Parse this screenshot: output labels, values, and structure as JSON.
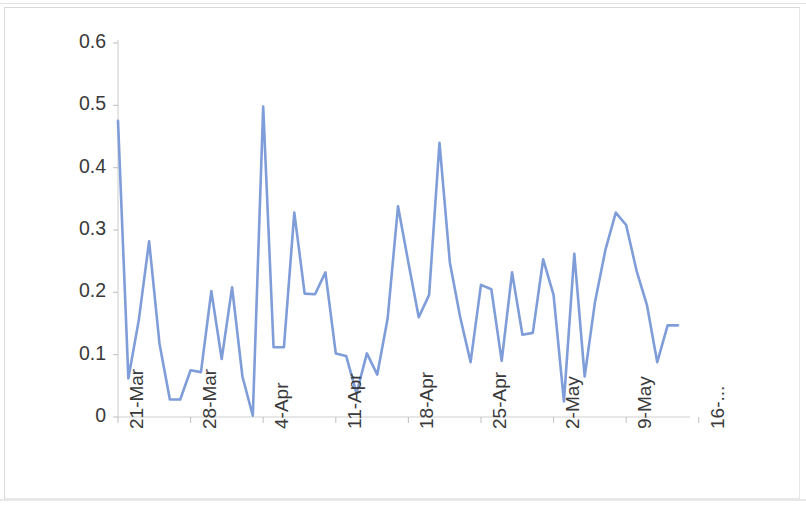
{
  "chart_data": {
    "type": "line",
    "title": "",
    "subtitle": "",
    "xlabel": "",
    "ylabel": "",
    "ylim": [
      0,
      0.6
    ],
    "ytick_labels": [
      "0.6",
      "0.5",
      "0.4",
      "0.3",
      "0.2",
      "0.1",
      "0"
    ],
    "ytick_values": [
      0.6,
      0.5,
      0.4,
      0.3,
      0.2,
      0.1,
      0
    ],
    "xtick_labels": [
      "21-Mar",
      "28-Mar",
      "4-Apr",
      "11-Apr",
      "18-Apr",
      "25-Apr",
      "2-May",
      "9-May",
      "16-..."
    ],
    "xtick_indices": [
      0,
      7,
      14,
      21,
      28,
      35,
      42,
      49,
      56
    ],
    "grid": false,
    "legend": "none",
    "line_color": "#7f9dd9",
    "line_width": 2.6,
    "markers": false,
    "series": [
      {
        "name": "Series 1",
        "values": [
          0.475,
          0.062,
          0.155,
          0.282,
          0.118,
          0.028,
          0.028,
          0.075,
          0.072,
          0.202,
          0.093,
          0.208,
          0.065,
          0.002,
          0.498,
          0.112,
          0.112,
          0.328,
          0.198,
          0.197,
          0.232,
          0.102,
          0.098,
          0.038,
          0.102,
          0.068,
          0.158,
          0.338,
          0.248,
          0.16,
          0.196,
          0.44,
          0.248,
          0.16,
          0.088,
          0.212,
          0.205,
          0.09,
          0.232,
          0.132,
          0.135,
          0.253,
          0.196,
          0.025,
          0.262,
          0.065,
          0.185,
          0.268,
          0.328,
          0.308,
          0.235,
          0.18,
          0.088,
          0.147,
          0.147
        ]
      }
    ]
  }
}
